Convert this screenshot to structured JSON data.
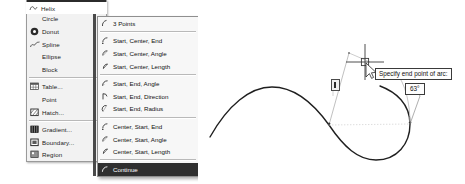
{
  "app": {
    "context": "cad-draw-menu",
    "canvas_background": "#ffffff",
    "highlight_color": "#2b2b2b",
    "menu_background": "#f2f2f2",
    "submenu_background": "#f7f7f7"
  },
  "top_item": {
    "label": "Helix",
    "icon": "helix-icon"
  },
  "parent_menu": {
    "items": [
      {
        "label": "Arc",
        "icon": "arc-icon",
        "submenu": true,
        "selected": true,
        "separator_after": false
      },
      {
        "label": "Circle",
        "icon": "circle-icon",
        "submenu": true,
        "selected": false,
        "separator_after": false
      },
      {
        "label": "Donut",
        "icon": "donut-icon",
        "submenu": false,
        "selected": false,
        "separator_after": false
      },
      {
        "label": "Spline",
        "icon": "spline-icon",
        "submenu": false,
        "selected": false,
        "separator_after": false
      },
      {
        "label": "Ellipse",
        "icon": "ellipse-icon",
        "submenu": true,
        "selected": false,
        "separator_after": false
      },
      {
        "label": "Block",
        "icon": "block-icon",
        "submenu": true,
        "selected": false,
        "separator_after": true
      },
      {
        "label": "Table...",
        "icon": "table-icon",
        "submenu": false,
        "selected": false,
        "separator_after": false
      },
      {
        "label": "Point",
        "icon": "point-icon",
        "submenu": true,
        "selected": false,
        "separator_after": false
      },
      {
        "label": "Hatch...",
        "icon": "hatch-icon",
        "submenu": false,
        "selected": false,
        "separator_after": true
      },
      {
        "label": "Gradient...",
        "icon": "gradient-icon",
        "submenu": false,
        "selected": false,
        "separator_after": false
      },
      {
        "label": "Boundary...",
        "icon": "boundary-icon",
        "submenu": false,
        "selected": false,
        "separator_after": false
      },
      {
        "label": "Region",
        "icon": "region-icon",
        "submenu": false,
        "selected": false,
        "separator_after": false
      }
    ]
  },
  "sub_menu": {
    "items": [
      {
        "label": "3 Points",
        "icon": "arc-3points-icon",
        "selected": false,
        "separator_after": true
      },
      {
        "label": "Start, Center, End",
        "icon": "arc-start-center-end-icon",
        "selected": false,
        "separator_after": false
      },
      {
        "label": "Start, Center, Angle",
        "icon": "arc-start-center-angle-icon",
        "selected": false,
        "separator_after": false
      },
      {
        "label": "Start, Center, Length",
        "icon": "arc-start-center-length-icon",
        "selected": false,
        "separator_after": true
      },
      {
        "label": "Start, End, Angle",
        "icon": "arc-start-end-angle-icon",
        "selected": false,
        "separator_after": false
      },
      {
        "label": "Start, End, Direction",
        "icon": "arc-start-end-direction-icon",
        "selected": false,
        "separator_after": false
      },
      {
        "label": "Start, End, Radius",
        "icon": "arc-start-end-radius-icon",
        "selected": false,
        "separator_after": true
      },
      {
        "label": "Center, Start, End",
        "icon": "arc-center-start-end-icon",
        "selected": false,
        "separator_after": false
      },
      {
        "label": "Center, Start, Angle",
        "icon": "arc-center-start-angle-icon",
        "selected": false,
        "separator_after": false
      },
      {
        "label": "Center, Start, Length",
        "icon": "arc-center-start-length-icon",
        "selected": false,
        "separator_after": true
      },
      {
        "label": "Continue",
        "icon": "arc-continue-icon",
        "selected": true,
        "separator_after": false
      }
    ]
  },
  "canvas": {
    "prompt_tooltip": "Specify end point of arc:",
    "angle_tooltip": "63°",
    "cursor": "crosshair-with-arrow",
    "grip_marker": "arc-grip-marker"
  }
}
